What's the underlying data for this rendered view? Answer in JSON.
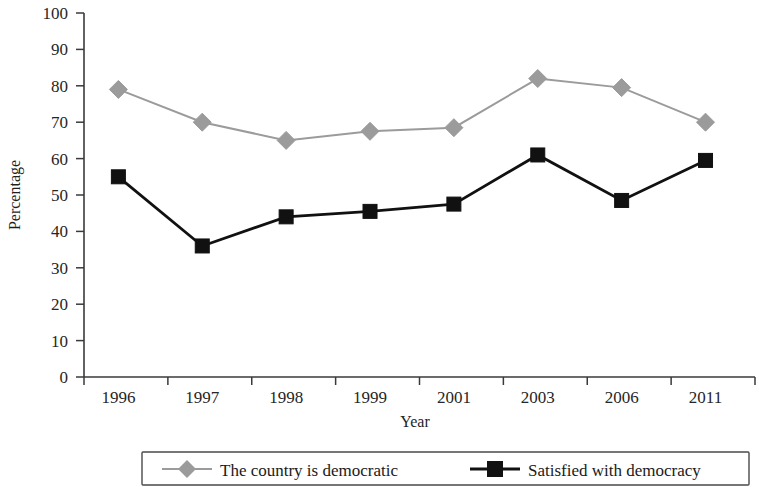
{
  "chart_data": {
    "type": "line",
    "title": "",
    "xlabel": "Year",
    "ylabel": "Percentage",
    "categories": [
      "1996",
      "1997",
      "1998",
      "1999",
      "2001",
      "2003",
      "2006",
      "2011"
    ],
    "ylim": [
      0,
      100
    ],
    "ytick_step": 10,
    "yticks": [
      "0",
      "10",
      "20",
      "30",
      "40",
      "50",
      "60",
      "70",
      "80",
      "90",
      "100"
    ],
    "grid": false,
    "legend_position": "bottom",
    "series": [
      {
        "name": "The country is democratic",
        "marker": "diamond",
        "color": "#9b9b9b",
        "values": [
          79,
          70,
          65,
          67.5,
          68.5,
          82,
          79.5,
          70
        ]
      },
      {
        "name": "Satisfied with democracy",
        "marker": "square",
        "color": "#111111",
        "values": [
          55,
          36,
          44,
          45.5,
          47.5,
          61,
          48.5,
          59.5
        ]
      }
    ]
  },
  "axes": {
    "y_title": "Percentage",
    "x_title": "Year"
  },
  "legend": {
    "items": [
      {
        "label": "The country is democratic",
        "marker": "diamond-marker",
        "color": "#9b9b9b"
      },
      {
        "label": "Satisfied with democracy",
        "marker": "square-marker",
        "color": "#111111"
      }
    ]
  }
}
